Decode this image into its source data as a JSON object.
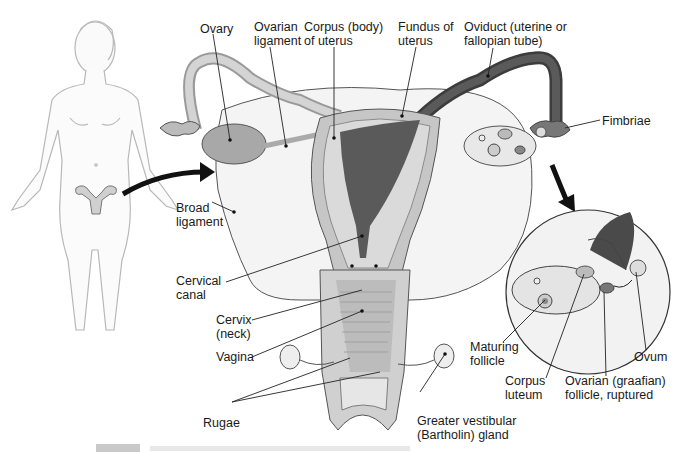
{
  "figure": {
    "palette": {
      "background": "#ffffff",
      "tissue_light": "#e6e6e6",
      "tissue_mid": "#bdbdbd",
      "tissue_dark": "#6a6a6a",
      "cavity": "#5a5a5a",
      "ligament": "#f3f3f3",
      "outline": "#555555",
      "leader": "#222222"
    },
    "labels": {
      "ovary": "Ovary",
      "ovarian_ligament_1": "Ovarian",
      "ovarian_ligament_2": "ligament",
      "corpus_1": "Corpus (body)",
      "corpus_2": "of uterus",
      "fundus_1": "Fundus of",
      "fundus_2": "uterus",
      "oviduct_1": "Oviduct (uterine or",
      "oviduct_2": "fallopian tube)",
      "fimbriae": "Fimbriae",
      "broad_1": "Broad",
      "broad_2": "ligament",
      "cervical_canal_1": "Cervical",
      "cervical_canal_2": "canal",
      "cervix_1": "Cervix",
      "cervix_2": "(neck)",
      "vagina": "Vagina",
      "rugae": "Rugae",
      "bartholin_1": "Greater vestibular",
      "bartholin_2": "(Bartholin) gland",
      "maturing_1": "Maturing",
      "maturing_2": "follicle",
      "corpus_luteum_1": "Corpus",
      "corpus_luteum_2": "luteum",
      "graafian_1": "Ovarian (graafian)",
      "graafian_2": "follicle, ruptured",
      "ovum": "Ovum"
    }
  }
}
